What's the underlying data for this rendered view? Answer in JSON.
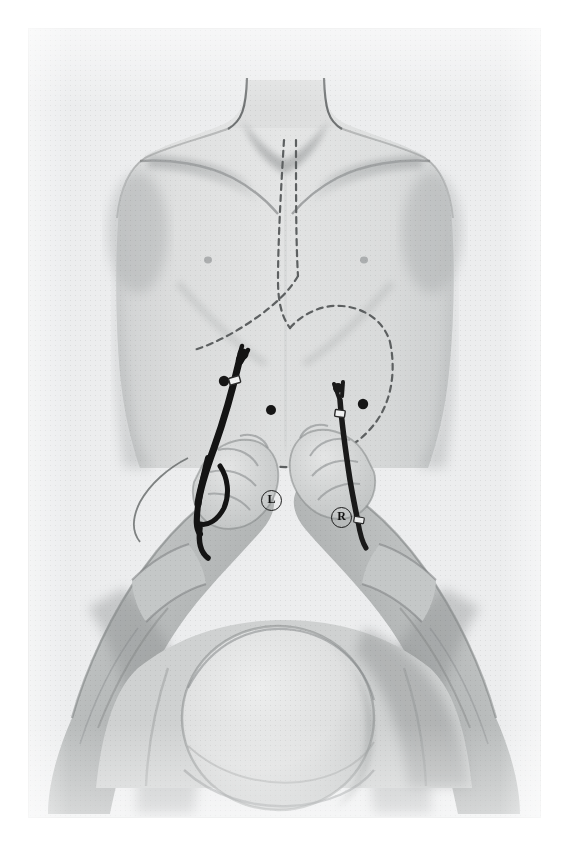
{
  "figure": {
    "kind": "surgical-illustration",
    "view": "Patient supine, viewed from the foot of the operating table; surgeon stands between the patient's legs",
    "technique": "grayscale wash drawing / halftone printed plate",
    "background_color": "#eceded",
    "page_color": "#ffffff",
    "ink_color": "#1b1b1b",
    "skin_tone": "#d8d9d9",
    "shadow_tone": "#9a9c9d"
  },
  "labels": {
    "left_instrument": "L",
    "right_instrument": "R"
  },
  "anatomy": {
    "dashed_outline_name": "stomach and esophagus outline",
    "dashed_outline_style": "dashed",
    "parts": [
      "neck",
      "left shoulder",
      "right shoulder",
      "clavicle",
      "chest",
      "costal margin",
      "abdomen",
      "nipple"
    ]
  },
  "ports": {
    "count": 3,
    "label": "trocar port sites",
    "sites": [
      {
        "name": "left-subcostal-port",
        "x": 224,
        "y": 381
      },
      {
        "name": "epigastric-port",
        "x": 271,
        "y": 410
      },
      {
        "name": "right-subcostal-port",
        "x": 363,
        "y": 404
      }
    ]
  },
  "instruments": [
    {
      "name": "left-laparoscopic-grasper",
      "marker": "L",
      "held_by": "surgeon's left hand",
      "shaft_color": "#141414"
    },
    {
      "name": "right-laparoscopic-grasper",
      "marker": "R",
      "held_by": "surgeon's right hand",
      "shaft_color": "#1a1a1a"
    }
  ],
  "surgeon": {
    "visible_parts": [
      "surgical cap",
      "head",
      "forearms",
      "hands",
      "gloves"
    ],
    "position": "foot of table, leaning over the abdomen"
  }
}
